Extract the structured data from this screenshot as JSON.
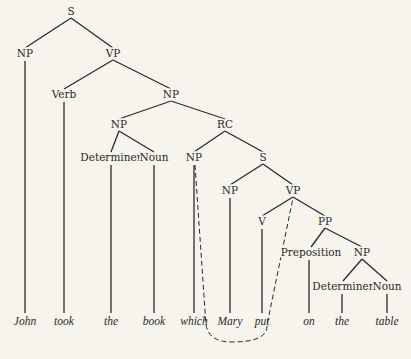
{
  "diagram": {
    "type": "syntax-tree",
    "nodes": [
      {
        "id": "S1",
        "label": "S",
        "x": 71,
        "y": 15
      },
      {
        "id": "NP1",
        "label": "NP",
        "x": 25,
        "y": 57
      },
      {
        "id": "VP1",
        "label": "VP",
        "x": 113,
        "y": 57
      },
      {
        "id": "Verb",
        "label": "Verb",
        "x": 64,
        "y": 98
      },
      {
        "id": "NP2",
        "label": "NP",
        "x": 171,
        "y": 98
      },
      {
        "id": "NP3",
        "label": "NP",
        "x": 119,
        "y": 128
      },
      {
        "id": "RC",
        "label": "RC",
        "x": 225,
        "y": 128
      },
      {
        "id": "Det1",
        "label": "Determiner",
        "x": 111,
        "y": 161
      },
      {
        "id": "Noun1",
        "label": "Noun",
        "x": 154,
        "y": 161
      },
      {
        "id": "NP4",
        "label": "NP",
        "x": 194,
        "y": 161
      },
      {
        "id": "S2",
        "label": "S",
        "x": 263,
        "y": 161
      },
      {
        "id": "NP5",
        "label": "NP",
        "x": 230,
        "y": 194
      },
      {
        "id": "VP2",
        "label": "VP",
        "x": 293,
        "y": 194
      },
      {
        "id": "V",
        "label": "V",
        "x": 262,
        "y": 225
      },
      {
        "id": "PP",
        "label": "PP",
        "x": 325,
        "y": 225
      },
      {
        "id": "Prep",
        "label": "Preposition",
        "x": 311,
        "y": 256
      },
      {
        "id": "NP6",
        "label": "NP",
        "x": 362,
        "y": 256
      },
      {
        "id": "Det2",
        "label": "Determiner",
        "x": 343,
        "y": 290
      },
      {
        "id": "Noun2",
        "label": "Noun",
        "x": 387,
        "y": 290
      }
    ],
    "edges": [
      [
        "S1",
        "NP1"
      ],
      [
        "S1",
        "VP1"
      ],
      [
        "VP1",
        "Verb"
      ],
      [
        "VP1",
        "NP2"
      ],
      [
        "NP2",
        "NP3"
      ],
      [
        "NP2",
        "RC"
      ],
      [
        "NP3",
        "Det1"
      ],
      [
        "NP3",
        "Noun1"
      ],
      [
        "RC",
        "NP4"
      ],
      [
        "RC",
        "S2"
      ],
      [
        "S2",
        "NP5"
      ],
      [
        "S2",
        "VP2"
      ],
      [
        "VP2",
        "V"
      ],
      [
        "VP2",
        "PP"
      ],
      [
        "PP",
        "Prep"
      ],
      [
        "PP",
        "NP6"
      ],
      [
        "NP6",
        "Det2"
      ],
      [
        "NP6",
        "Noun2"
      ]
    ],
    "words": [
      {
        "text": "John",
        "x": 25,
        "parent": "NP1"
      },
      {
        "text": "took",
        "x": 64,
        "parent": "Verb"
      },
      {
        "text": "the",
        "x": 111,
        "parent": "Det1"
      },
      {
        "text": "book",
        "x": 154,
        "parent": "Noun1"
      },
      {
        "text": "which",
        "x": 194,
        "parent": "NP4"
      },
      {
        "text": "Mary",
        "x": 230,
        "parent": "NP5"
      },
      {
        "text": "put",
        "x": 262,
        "parent": "V"
      },
      {
        "text": "on",
        "x": 309,
        "parent": "Prep"
      },
      {
        "text": "the",
        "x": 342,
        "parent": "Det2"
      },
      {
        "text": "table",
        "x": 387,
        "parent": "Noun2"
      }
    ],
    "word_baseline_y": 325,
    "dashed_link": {
      "from": "NP4",
      "to": "VP2",
      "description": "dashed loop linking relative pronoun NP to VP gap"
    }
  }
}
